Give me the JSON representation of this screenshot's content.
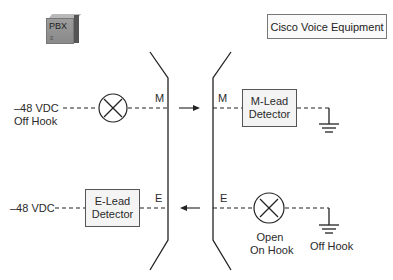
{
  "pbx": {
    "label": "PBX",
    "vent": "≡"
  },
  "cisco_label": "Cisco Voice Equipment",
  "m_lead": {
    "source_line1": "–48 VDC",
    "source_line2": "Off Hook",
    "left_letter": "M",
    "right_letter": "M",
    "detector_line1": "M-Lead",
    "detector_line2": "Detector",
    "arrow_direction": "right"
  },
  "e_lead": {
    "source": "–48 VDC",
    "detector_line1": "E-Lead",
    "detector_line2": "Detector",
    "left_letter": "E",
    "right_letter": "E",
    "switch_line1": "Open",
    "switch_line2": "On Hook",
    "ground_label": "Off Hook",
    "arrow_direction": "left"
  },
  "icons": [
    "pbx-icon",
    "lamp-x-icon",
    "ground-icon",
    "switch-x-icon"
  ]
}
